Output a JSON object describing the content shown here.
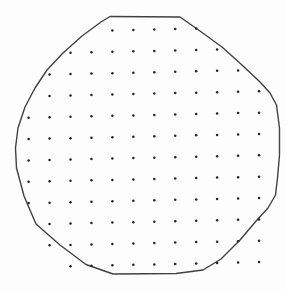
{
  "figure": {
    "type": "diagram",
    "subject": "circular-outline-with-dot-grid",
    "canvas": {
      "width": 286,
      "height": 294,
      "background": "#fdfdfd"
    },
    "outline": {
      "shape": "irregular-circle-polygon",
      "stroke": "#414141",
      "stroke_width": 1.4,
      "fill": "none",
      "points": [
        [
          110,
          16.5
        ],
        [
          180,
          17
        ],
        [
          200,
          31
        ],
        [
          222,
          47
        ],
        [
          242,
          65
        ],
        [
          260,
          82
        ],
        [
          270,
          93
        ],
        [
          276.5,
          105
        ],
        [
          279.5,
          128
        ],
        [
          279.5,
          155
        ],
        [
          277.5,
          178
        ],
        [
          275.5,
          195
        ],
        [
          268,
          208
        ],
        [
          257,
          220
        ],
        [
          240,
          240
        ],
        [
          221,
          259
        ],
        [
          203,
          270
        ],
        [
          176,
          273.5
        ],
        [
          113,
          274
        ],
        [
          86,
          264.5
        ],
        [
          60,
          245
        ],
        [
          36,
          224
        ],
        [
          24,
          196
        ],
        [
          16.5,
          168
        ],
        [
          15.5,
          148
        ],
        [
          18,
          128
        ],
        [
          25,
          107
        ],
        [
          35,
          88
        ],
        [
          47,
          70
        ],
        [
          63,
          53
        ],
        [
          82,
          36
        ],
        [
          101,
          22
        ]
      ]
    },
    "dot_grid": {
      "fill": "#232323",
      "radius": 1.25,
      "x0": 28.6,
      "y0": 32.3,
      "col_spacing": 20.95,
      "row_spacing": 21.35,
      "row_shear": -0.022,
      "total_dots": 126,
      "rows": [
        {
          "row": 0,
          "col_start": 4,
          "col_end": 8
        },
        {
          "row": 1,
          "col_start": 2,
          "col_end": 9
        },
        {
          "row": 2,
          "col_start": 1,
          "col_end": 10
        },
        {
          "row": 3,
          "col_start": 1,
          "col_end": 11
        },
        {
          "row": 4,
          "col_start": 0,
          "col_end": 11
        },
        {
          "row": 5,
          "col_start": 0,
          "col_end": 11
        },
        {
          "row": 6,
          "col_start": 0,
          "col_end": 11
        },
        {
          "row": 7,
          "col_start": 0,
          "col_end": 11
        },
        {
          "row": 8,
          "col_start": 0,
          "col_end": 11
        },
        {
          "row": 9,
          "col_start": 1,
          "col_end": 11
        },
        {
          "row": 10,
          "col_start": 1,
          "col_end": 11
        },
        {
          "row": 11,
          "col_start": 2,
          "col_end": 11
        }
      ]
    }
  }
}
